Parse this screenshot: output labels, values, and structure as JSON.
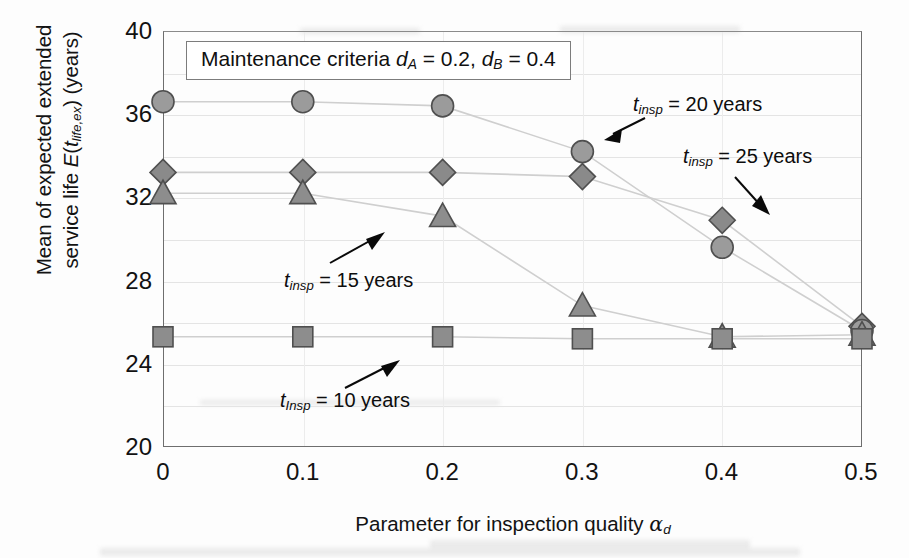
{
  "chart_data": {
    "type": "line",
    "title": "Maintenance criteria dA = 0.2, dB = 0.4",
    "xlabel": "Parameter for inspection quality αd",
    "ylabel": "Mean of expected extended service life E(tlife,ex) (years)",
    "x": [
      0,
      0.1,
      0.2,
      0.3,
      0.4,
      0.5
    ],
    "xlim": [
      0,
      0.5
    ],
    "ylim": [
      20,
      40
    ],
    "xticks": [
      "0",
      "0.1",
      "0.2",
      "0.3",
      "0.4",
      "0.5"
    ],
    "yticks": [
      "20",
      "24",
      "28",
      "32",
      "36",
      "40"
    ],
    "grid": true,
    "legend_position": "inline-annotations",
    "series": [
      {
        "name": "tinsp = 25 years",
        "marker": "diamond",
        "color": "#8a8a8a",
        "values": [
          33.2,
          33.2,
          33.2,
          33.0,
          30.9,
          25.8
        ]
      },
      {
        "name": "tinsp = 20 years",
        "marker": "circle",
        "color": "#9b9b9b",
        "values": [
          36.6,
          36.6,
          36.4,
          34.2,
          29.6,
          25.6
        ]
      },
      {
        "name": "tinsp = 15 years",
        "marker": "triangle",
        "color": "#8d8d8d",
        "values": [
          32.2,
          32.2,
          31.1,
          26.8,
          25.3,
          25.4
        ]
      },
      {
        "name": "tinsp = 10 years",
        "marker": "square",
        "color": "#8d8d8d",
        "values": [
          25.3,
          25.3,
          25.3,
          25.2,
          25.2,
          25.2
        ]
      }
    ]
  },
  "title_box": {
    "prefix": "Maintenance criteria ",
    "d_a_symbol": "d",
    "d_a_sub": "A",
    "d_a_eq": " = 0.2, ",
    "d_b_symbol": "d",
    "d_b_sub": "B",
    "d_b_eq": " = 0.4"
  },
  "axes": {
    "y_title_line1": "Mean of expected extended",
    "y_title_line2_pre": "service life ",
    "y_title_e": "E",
    "y_title_paren_open": "(",
    "y_title_t": "t",
    "y_title_sub": "life,ex",
    "y_title_paren_close": ")",
    "y_title_units": " (years)",
    "x_title_pre": "Parameter for inspection quality ",
    "x_title_alpha": "α",
    "x_title_alpha_sub": "d",
    "yticks": [
      "40",
      "36",
      "32",
      "28",
      "24",
      "20"
    ],
    "xticks": [
      "0",
      "0.1",
      "0.2",
      "0.3",
      "0.4",
      "0.5"
    ]
  },
  "annotations": [
    {
      "id": "annot-20",
      "t_symbol": "t",
      "t_sub": "insp",
      "text": " = 20 years"
    },
    {
      "id": "annot-25",
      "t_symbol": "t",
      "t_sub": "insp",
      "text": " = 25 years"
    },
    {
      "id": "annot-15",
      "t_symbol": "t",
      "t_sub": "insp",
      "text": " = 15 years"
    },
    {
      "id": "annot-10",
      "t_symbol": "t",
      "t_sub": "Insp",
      "text": " = 10 years"
    }
  ]
}
